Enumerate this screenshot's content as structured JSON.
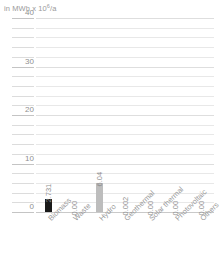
{
  "chart_data": {
    "type": "bar",
    "title": "",
    "subtitle": "",
    "unit_caption": "in MWh x 10",
    "unit_exponent": "6",
    "unit_suffix": "/a",
    "xlabel": "",
    "ylabel": "in MWh x 10⁶/a",
    "ylim": [
      0,
      40
    ],
    "ytick_labels": [
      "0",
      "10",
      "20",
      "30",
      "40"
    ],
    "ytick_values": [
      0,
      10,
      20,
      30,
      40
    ],
    "minor_tick_step": 2,
    "grid": true,
    "legend": "none",
    "categories": [
      "Biomass",
      "Waste",
      "Hydro",
      "Geothermal",
      "Solar thermal",
      "Photovoltaic",
      "Others"
    ],
    "values": [
      2.731,
      0.0,
      6.04,
      0.002,
      0.0,
      0.0,
      0.0
    ],
    "value_labels": [
      "2.731",
      "0.00",
      "6.04",
      "0.002",
      "0.00",
      "0.00",
      "0.00"
    ],
    "bar_colors": [
      "#1a1a1a",
      "#bdbdbd",
      "#bdbdbd",
      "#bdbdbd",
      "#bdbdbd",
      "#bdbdbd",
      "#bdbdbd"
    ]
  },
  "colors": {
    "background": "#ffffff",
    "grid_minor": "#e8e8e8",
    "grid_major": "#dedede",
    "baseline": "#c9c9c9",
    "text": "#8f8f8f",
    "bar_dark": "#1a1a1a",
    "bar_gray": "#bdbdbd"
  }
}
